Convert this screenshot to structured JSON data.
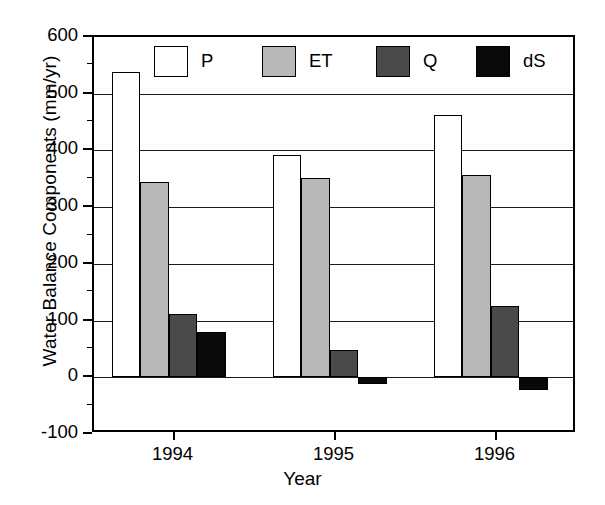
{
  "chart_data": {
    "type": "bar",
    "title": "",
    "xlabel": "Year",
    "ylabel": "Water Balance Components (mm/yr)",
    "categories": [
      "1994",
      "1995",
      "1996"
    ],
    "series": [
      {
        "name": "P",
        "label": "P",
        "color": "#ffffff",
        "values": [
          538,
          392,
          463
        ]
      },
      {
        "name": "ET",
        "label": "ET",
        "color": "#b8b8b8",
        "values": [
          345,
          352,
          357
        ]
      },
      {
        "name": "Q",
        "label": "Q",
        "color": "#4a4a4a",
        "values": [
          111,
          48,
          126
        ]
      },
      {
        "name": "dS",
        "label": "dS",
        "color": "#090909",
        "values": [
          79,
          -11,
          -22
        ]
      }
    ],
    "ylim": [
      -100,
      600
    ],
    "ytick_values": [
      -100,
      0,
      100,
      200,
      300,
      400,
      500,
      600
    ],
    "ytick_labels": [
      "-100",
      "0",
      "100",
      "200",
      "300",
      "400",
      "500",
      "600"
    ],
    "yminor_step": 50,
    "grid": "horizontal",
    "legend_position": "top-inside",
    "legend_entries": [
      "P",
      "ET",
      "Q",
      "dS"
    ]
  }
}
